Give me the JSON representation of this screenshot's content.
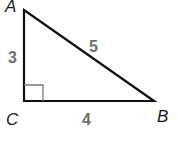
{
  "diagram": {
    "type": "right-triangle",
    "vertices": {
      "A": {
        "label": "A",
        "x": 24,
        "y": 10
      },
      "B": {
        "label": "B",
        "x": 154,
        "y": 101
      },
      "C": {
        "label": "C",
        "x": 24,
        "y": 101
      }
    },
    "sides": {
      "AC": {
        "label": "3"
      },
      "CB": {
        "label": "4"
      },
      "AB": {
        "label": "5"
      }
    },
    "right_angle_at": "C",
    "colors": {
      "line": "#111111",
      "vertex_text": "#1a1a1a",
      "side_text": "#6e6e6e",
      "right_angle_mark": "#777777"
    }
  }
}
